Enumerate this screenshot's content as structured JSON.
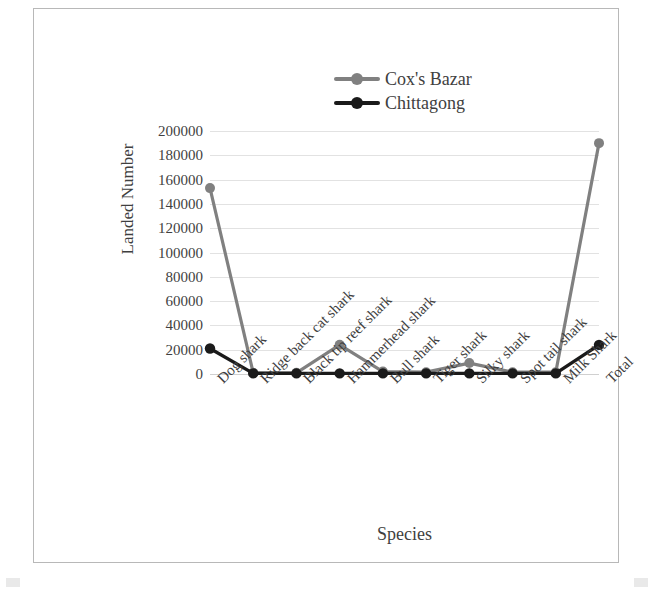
{
  "chart_data": {
    "type": "line",
    "title": "",
    "xlabel": "Species",
    "ylabel": "Landed Number",
    "ylim": [
      0,
      200000
    ],
    "ytick_step": 20000,
    "yticks": [
      "200000",
      "180000",
      "160000",
      "140000",
      "120000",
      "100000",
      "80000",
      "60000",
      "40000",
      "20000",
      "0"
    ],
    "grid": true,
    "legend_position": "top-center",
    "categories": [
      "Dog shark",
      "Ridge back cat shark",
      "Black tip reef shark",
      "Hammerhead shark",
      "Bull shark",
      "Tiger shark",
      "Silky shark",
      "Spot tail shark",
      "Milk Shark",
      "Total"
    ],
    "series": [
      {
        "name": "Cox's Bazar",
        "color": "#808080",
        "marker": "circle",
        "values": [
          153000,
          1000,
          1000,
          24000,
          2000,
          1500,
          9000,
          1500,
          1500,
          190000
        ]
      },
      {
        "name": "Chittagong",
        "color": "#1a1a1a",
        "marker": "circle",
        "values": [
          21000,
          500,
          500,
          500,
          500,
          500,
          500,
          500,
          500,
          24000
        ]
      }
    ]
  },
  "legend": {
    "items": [
      {
        "label": "Cox's Bazar",
        "color": "#808080"
      },
      {
        "label": "Chittagong",
        "color": "#1a1a1a"
      }
    ]
  },
  "caption": {
    "text": ""
  }
}
